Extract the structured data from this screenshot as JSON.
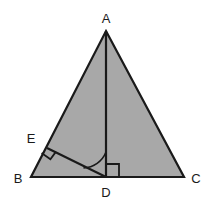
{
  "figure": {
    "background_color": "#ffffff",
    "fill_color": "#a8a8a8",
    "stroke_color": "#1a1a1a",
    "label_color": "#1a1a1a"
  },
  "labels": {
    "A": "A",
    "B": "B",
    "C": "C",
    "D": "D",
    "E": "E"
  },
  "points": {
    "A": {
      "x": 106,
      "y": 31
    },
    "B": {
      "x": 31,
      "y": 177
    },
    "C": {
      "x": 184,
      "y": 177
    },
    "D": {
      "x": 106,
      "y": 177
    },
    "E": {
      "x": 47,
      "y": 148
    }
  },
  "label_positions": {
    "A": {
      "x": 106,
      "y": 22
    },
    "B": {
      "x": 19,
      "y": 182
    },
    "C": {
      "x": 196,
      "y": 182
    },
    "D": {
      "x": 106,
      "y": 196
    },
    "E": {
      "x": 31,
      "y": 142
    }
  },
  "segments": [
    {
      "name": "AB",
      "from": "A",
      "to": "B"
    },
    {
      "name": "BC",
      "from": "B",
      "to": "C"
    },
    {
      "name": "CA",
      "from": "C",
      "to": "A"
    },
    {
      "name": "AD",
      "from": "A",
      "to": "D"
    },
    {
      "name": "ED",
      "from": "E",
      "to": "D"
    }
  ],
  "markers": {
    "right_angle_at_E": {
      "name": "right-angle-E",
      "description": "square marker showing DE perpendicular to AB",
      "path": "M 44.9 153.3 L 51.0 157.4 L 55.1 151.3"
    },
    "right_angle_at_D": {
      "name": "right-angle-D",
      "description": "square marker showing AD perpendicular to BC",
      "path": "M 106 165 L 118 165 L 118 177"
    },
    "angle_arc_at_D": {
      "name": "angle-arc-EDA",
      "description": "arc marking angle EDA",
      "path": "M 84 169 A 24 24 0 0 0 106 153"
    }
  }
}
